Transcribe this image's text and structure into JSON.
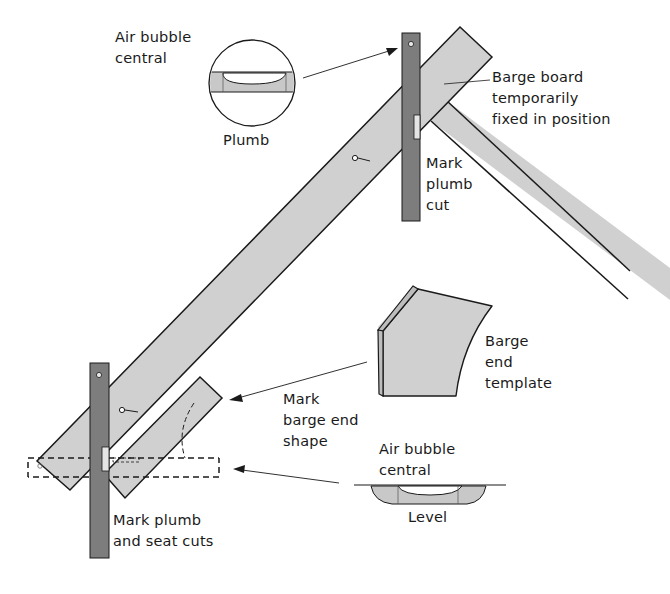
{
  "diagram": {
    "colors": {
      "timber_fill": "#d0d0d0",
      "level_fill": "#7d7d7d",
      "outline": "#1a1a1a",
      "background": "#ffffff"
    },
    "labels": {
      "air_bubble_top": "Air bubble\ncentral",
      "plumb": "Plumb",
      "barge_board": "Barge board\ntemporarily\nfixed in position",
      "mark_plumb_cut": "Mark\nplumb\ncut",
      "barge_end_template": "Barge\nend\ntemplate",
      "mark_barge_end_shape": "Mark\nbarge end\nshape",
      "air_bubble_bottom": "Air bubble\ncentral",
      "level": "Level",
      "mark_plumb_seat": "Mark plumb\nand seat cuts"
    }
  }
}
